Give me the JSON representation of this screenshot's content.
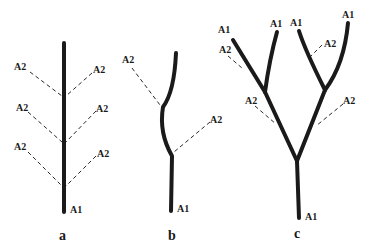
{
  "figure": {
    "panels": [
      {
        "id": "a",
        "caption": "a",
        "axis_label": "A1",
        "branch_labels": [
          "A2",
          "A2",
          "A2",
          "A2",
          "A2",
          "A2"
        ]
      },
      {
        "id": "b",
        "caption": "b",
        "axis_label": "A1",
        "branch_labels": [
          "A2",
          "A2"
        ]
      },
      {
        "id": "c",
        "caption": "c",
        "axis_labels": [
          "A1",
          "A1",
          "A1",
          "A1",
          "A1"
        ],
        "branch_labels": [
          "A2",
          "A2",
          "A2",
          "A2"
        ]
      }
    ],
    "colors": {
      "ink": "#1a1a1a",
      "background": "#ffffff"
    }
  }
}
